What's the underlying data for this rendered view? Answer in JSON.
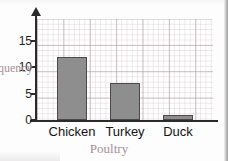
{
  "chart_data": {
    "type": "bar",
    "title": "",
    "categories": [
      "Chicken",
      "Turkey",
      "Duck"
    ],
    "values": [
      12,
      7,
      1
    ],
    "xlabel": "Poultry",
    "ylabel": "Frequency",
    "ylabel_visible_fragment": "cy",
    "ylim": [
      0,
      17
    ],
    "yticks": [
      0,
      5,
      10,
      15
    ],
    "ytick_labels": [
      "0",
      "5",
      "10",
      "15"
    ],
    "grid": true,
    "grid_minor": true,
    "legend": false,
    "legend_position": "none",
    "colors": {
      "bar_fill": "#8e8e8e",
      "bar_stroke": "#4a4a4a",
      "axis": "#2b2b2b",
      "grid_major": "#af96a0",
      "grid_minor": "#d2c3c8",
      "label_text": "#141414",
      "axis_title": "#a79098",
      "background": "#ffffff"
    }
  }
}
